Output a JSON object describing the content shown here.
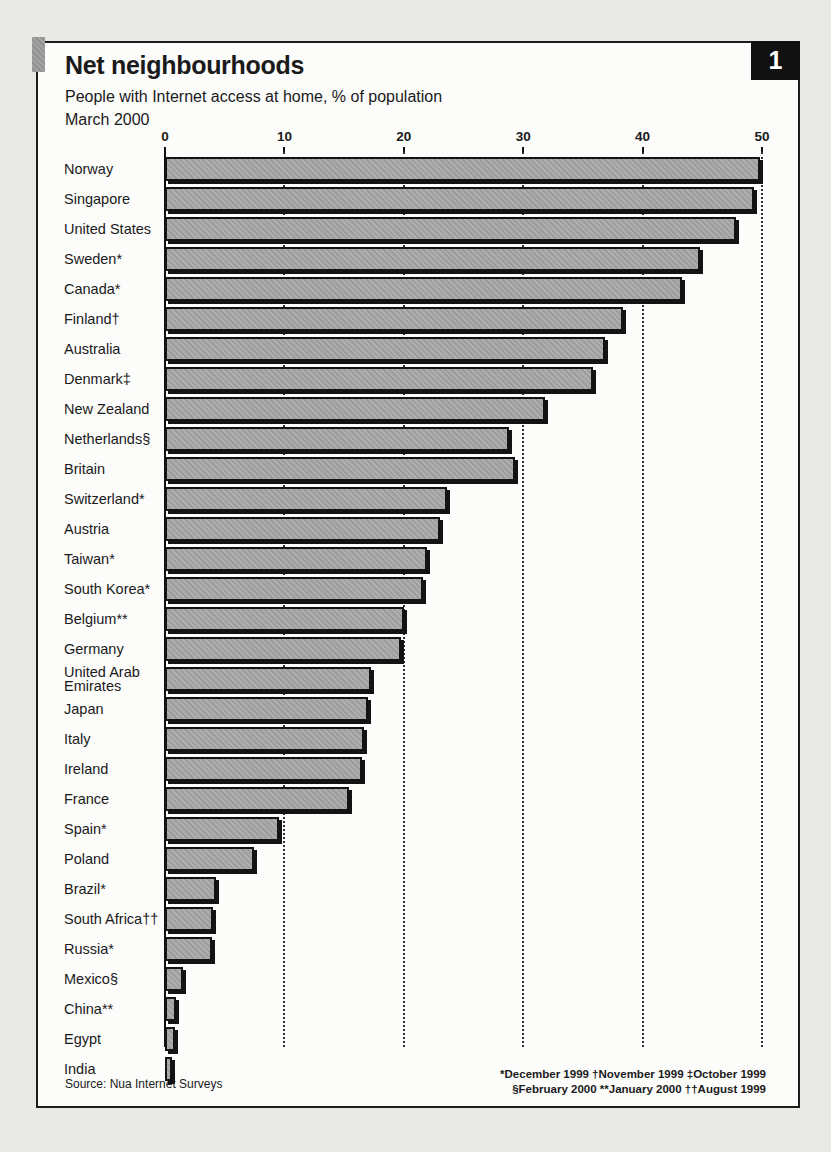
{
  "page": {
    "number_badge": "1"
  },
  "chart_data": {
    "type": "bar",
    "orientation": "horizontal",
    "title": "Net neighbourhoods",
    "subtitle": "People with Internet access at home, % of population",
    "date_label": "March 2000",
    "xlabel": "% of population",
    "xlim": [
      0,
      50
    ],
    "x_ticks": [
      0,
      10,
      20,
      30,
      40,
      50
    ],
    "grid": "dotted-vertical-behind-bars",
    "legend": "none",
    "categories": [
      "Norway",
      "Singapore",
      "United States",
      "Sweden*",
      "Canada*",
      "Finland†",
      "Australia",
      "Denmark‡",
      "New Zealand",
      "Netherlands§",
      "Britain",
      "Switzerland*",
      "Austria",
      "Taiwan*",
      "South Korea*",
      "Belgium**",
      "Germany",
      "United Arab Emirates",
      "Japan",
      "Italy",
      "Ireland",
      "France",
      "Spain*",
      "Poland",
      "Brazil*",
      "South Africa††",
      "Russia*",
      "Mexico§",
      "China**",
      "Egypt",
      "India"
    ],
    "values": [
      49.5,
      49,
      47.5,
      44.5,
      43,
      38,
      36.5,
      35.5,
      31.5,
      28.5,
      29,
      23.3,
      22.7,
      21.6,
      21.3,
      19.7,
      19.4,
      16.9,
      16.7,
      16.3,
      16.2,
      15.1,
      9.2,
      7.1,
      3.9,
      3.7,
      3.6,
      1.2,
      0.6,
      0.5,
      0.25
    ],
    "source": "Source: Nua Internet Surveys",
    "footnotes": [
      "*December 1999 †November 1999 ‡October 1999",
      "§February 2000 **January 2000 ††August 1999"
    ]
  },
  "colors": {
    "page_bg": "#e9e9e6",
    "figure_bg": "#fcfcfa",
    "bar_fill": "#a5a5a5",
    "bar_border": "#131313",
    "badge_bg": "#111111",
    "badge_text": "#ffffff",
    "text": "#1a1a1a"
  }
}
